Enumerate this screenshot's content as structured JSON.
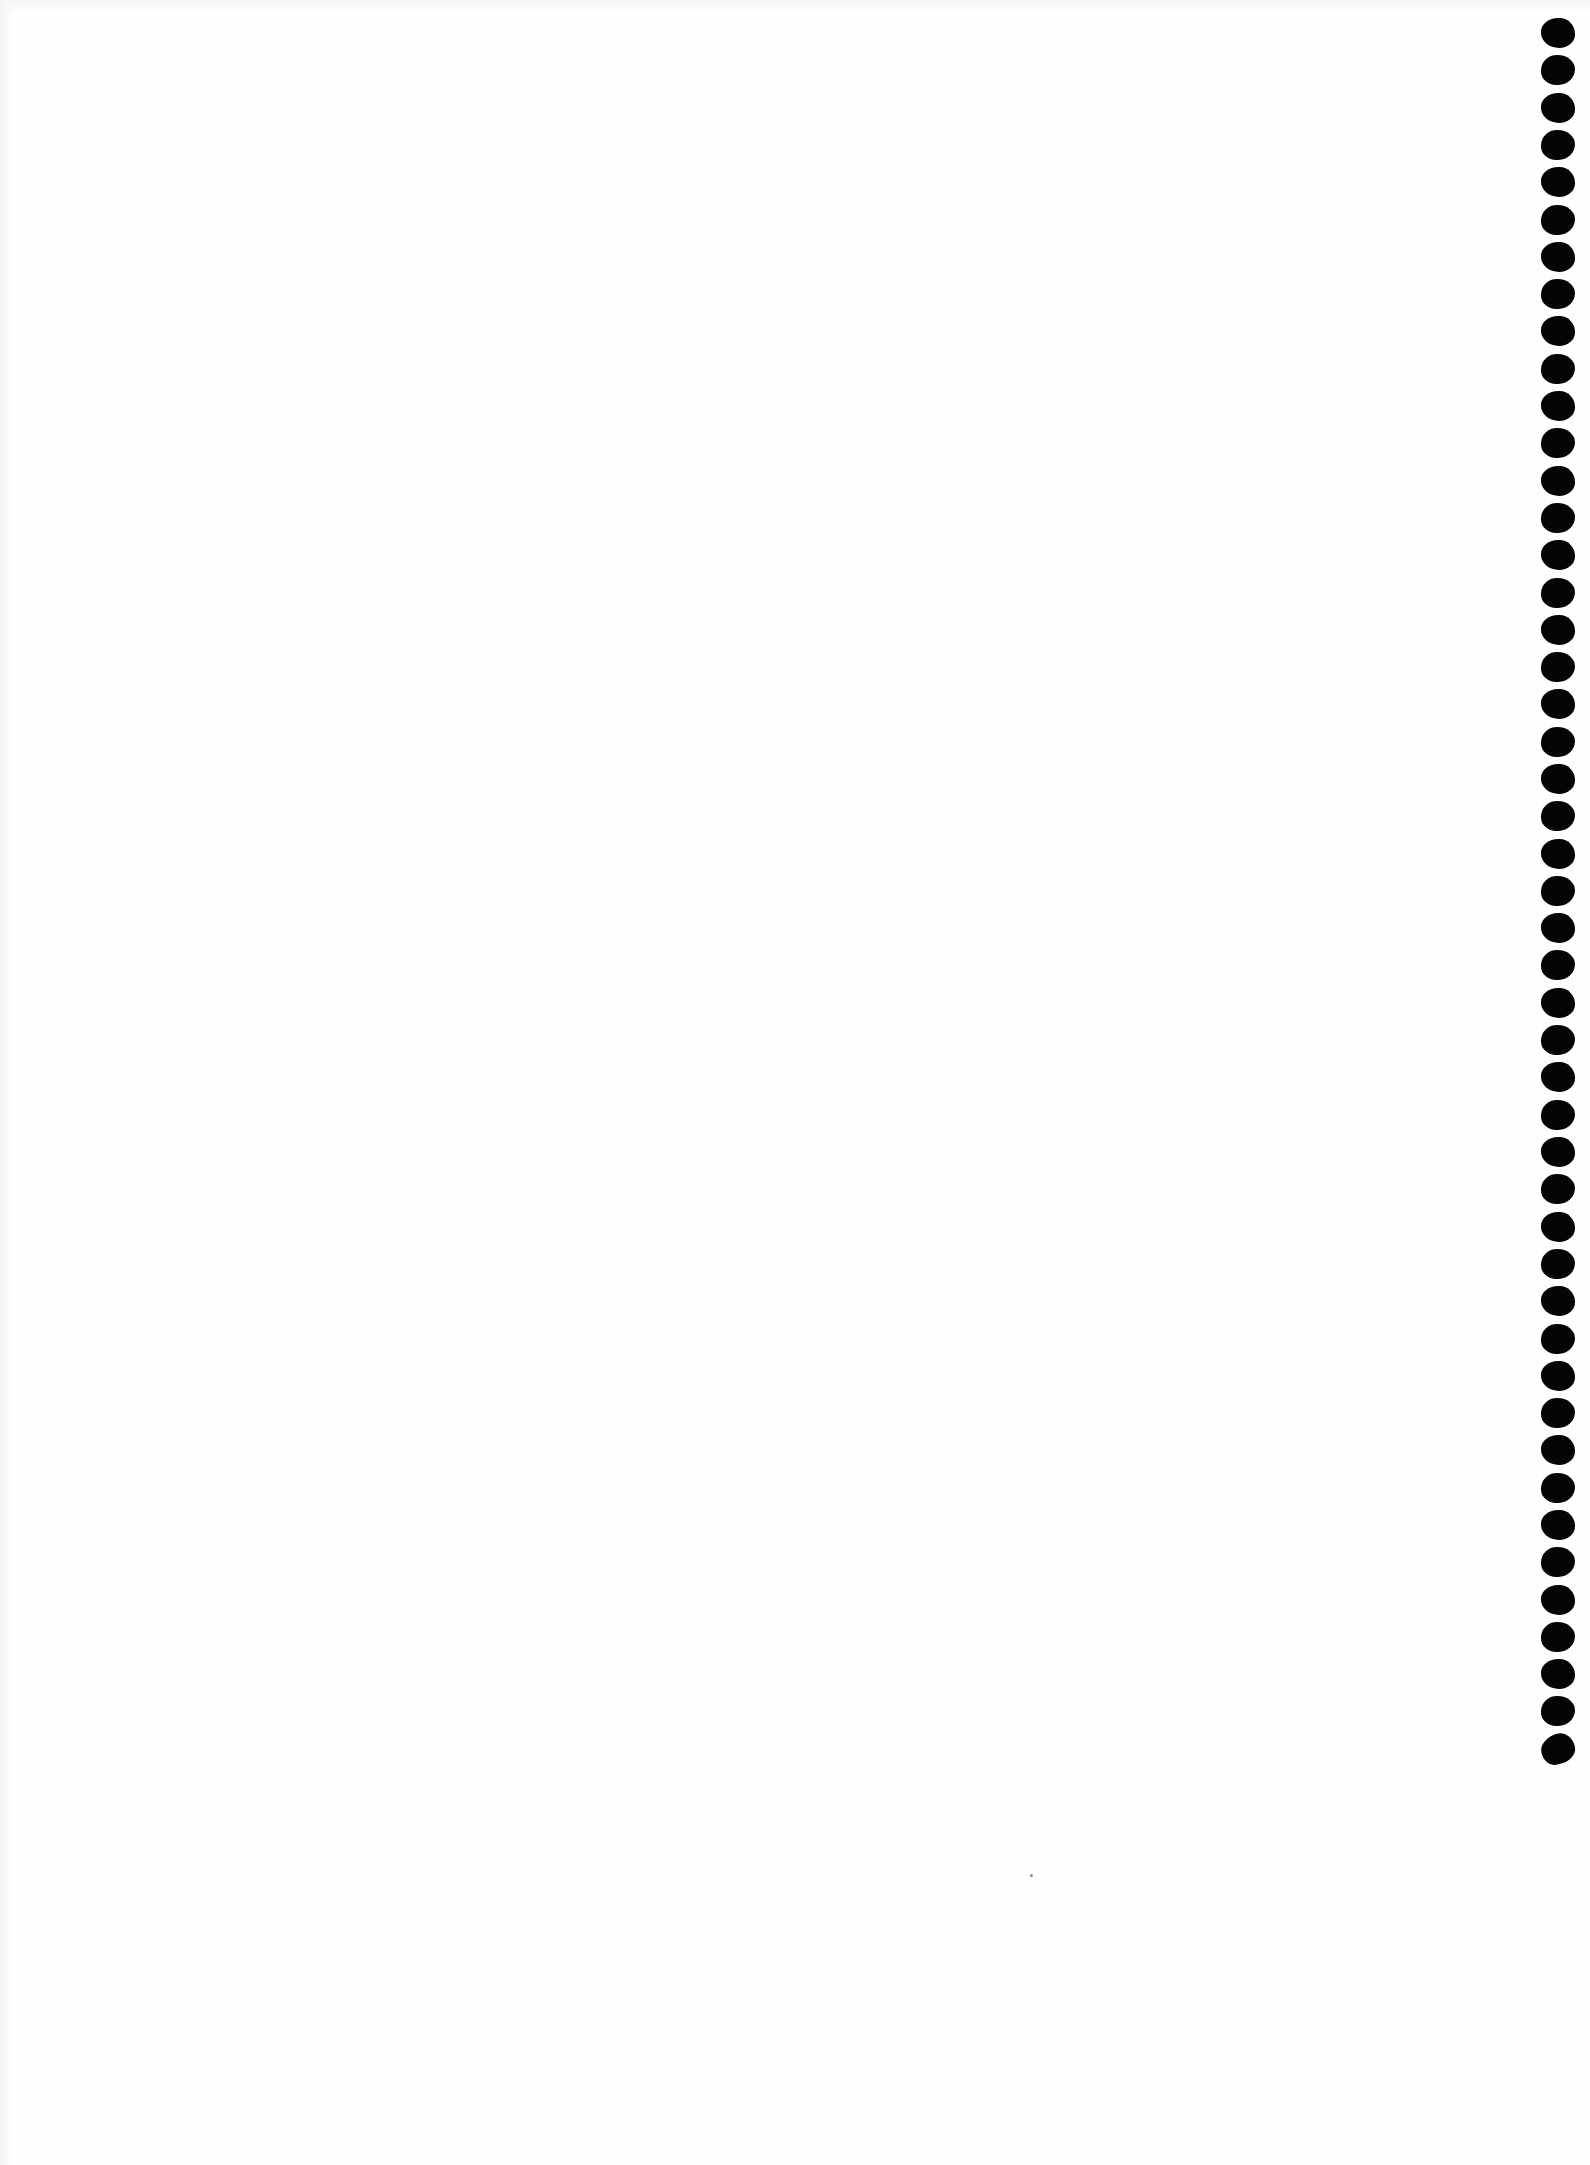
{
  "document": {
    "type": "scanned blank page",
    "background_color": "#fefefe",
    "text_content": ""
  },
  "punch_holes": {
    "side": "right",
    "count": 47,
    "color": "#050505",
    "x": 1541,
    "start_y": 18,
    "spacing": 37.3,
    "width": 34,
    "height": 30
  },
  "artifacts": [
    {
      "name": "dust-speck",
      "x": 1030,
      "y": 1874
    }
  ]
}
